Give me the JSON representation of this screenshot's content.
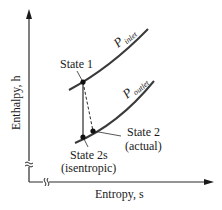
{
  "diagram": {
    "axes": {
      "y_label": "Enthalpy, h",
      "x_label": "Entropy, s",
      "axis_break_symbol": "≈"
    },
    "curves": [
      {
        "id": "p-inlet",
        "label_main": "P",
        "label_sub": "inlet"
      },
      {
        "id": "p-outlet",
        "label_main": "P",
        "label_sub": "outlet"
      }
    ],
    "states": [
      {
        "id": "state-1",
        "label": "State 1",
        "sublabel": ""
      },
      {
        "id": "state-2s",
        "label": "State 2s",
        "sublabel": "(isentropic)"
      },
      {
        "id": "state-2",
        "label": "State 2",
        "sublabel": "(actual)"
      }
    ],
    "processes": [
      {
        "from": "State 1",
        "to": "State 2s",
        "style": "solid",
        "meaning": "isentropic expansion"
      },
      {
        "from": "State 1",
        "to": "State 2",
        "style": "dashed",
        "meaning": "actual expansion"
      }
    ],
    "colors": {
      "line": "#2b2b2b",
      "curve": "#3a3a3a",
      "text": "#1a1a1a"
    }
  }
}
